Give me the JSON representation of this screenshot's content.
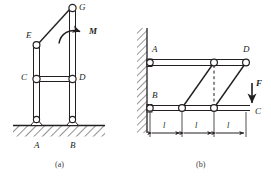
{
  "figure": {
    "caption_a": "(a)",
    "caption_b": "(b)",
    "stroke_color": "#231f20",
    "hatch_color": "#231f20",
    "background": "#ffffff"
  },
  "panel_a": {
    "name": "frame-with-applied-moment",
    "joint_labels": {
      "G": "G",
      "E": "E",
      "C": "C",
      "D": "D",
      "A": "A",
      "B": "B"
    },
    "load_label": "M",
    "load_type": "moment",
    "load_sense": "clockwise",
    "supports": [
      "pin-at-A",
      "pin-at-B"
    ],
    "ground": "hatched-fixed-ground",
    "members": [
      "column-A-to-E",
      "column-B-to-G",
      "beam-C-to-D",
      "diagonal-E-to-G"
    ]
  },
  "panel_b": {
    "name": "cantilever-truss",
    "joint_labels": {
      "A": "A",
      "B": "B",
      "C": "C",
      "D": "D"
    },
    "load_label": "F",
    "load_type": "force",
    "load_direction": "downward",
    "support": "wall-hatched-vertical",
    "dimension_labels": [
      "l",
      "l",
      "l"
    ],
    "dimension_count": 3,
    "members": [
      "top-chord-A-to-D",
      "bottom-chord-B-to-C",
      "diagonal-1",
      "diagonal-2",
      "dashed-vertical-center"
    ]
  }
}
